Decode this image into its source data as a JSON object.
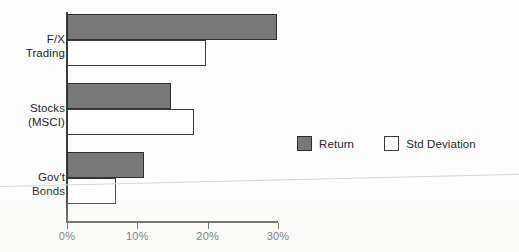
{
  "chart_data": {
    "type": "bar",
    "orientation": "horizontal",
    "title": "",
    "subtitle": "",
    "xlabel": "",
    "ylabel": "",
    "xlim": [
      0,
      30
    ],
    "xticks": [
      0,
      10,
      20,
      30
    ],
    "xtick_labels": [
      "0%",
      "10%",
      "20%",
      "30%"
    ],
    "grid": false,
    "legend_position": "center-right",
    "categories": [
      "F/X Trading",
      "Stocks (MSCI)",
      "Gov't Bonds"
    ],
    "category_lines": [
      [
        "F/X",
        "Trading"
      ],
      [
        "Stocks",
        "(MSCI)"
      ],
      [
        "Gov't",
        "Bonds"
      ]
    ],
    "series": [
      {
        "name": "Return",
        "color": "#787878",
        "edge_color": "#2f2f2f",
        "values": [
          29.9,
          14.8,
          10.9
        ]
      },
      {
        "name": "Std Deviation",
        "color": "#ffffff",
        "edge_color": "#3a3a3a",
        "values": [
          19.7,
          18.0,
          7.0
        ]
      }
    ],
    "units": "percent"
  },
  "legend": {
    "items": [
      {
        "label": "Return",
        "swatch": "filled"
      },
      {
        "label": "Std Deviation",
        "swatch": "hollow"
      }
    ]
  },
  "colors": {
    "return_fill": "#787878",
    "stddev_fill": "#ffffff",
    "axis": "#3b3b3b",
    "text": "#1f1f1f",
    "background": "#fdfdfd"
  }
}
